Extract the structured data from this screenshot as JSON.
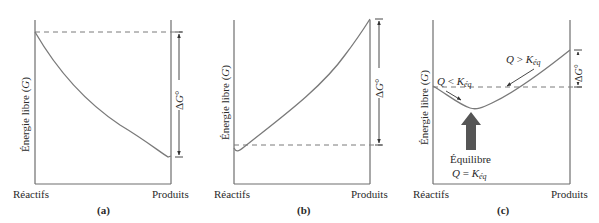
{
  "figure": {
    "panels": [
      {
        "id": "a",
        "caption": "(a)",
        "y_axis_label_prefix": "Énergie libre (",
        "y_axis_label_var": "G",
        "y_axis_label_suffix": ")",
        "x_left_label": "Réactifs",
        "x_right_label": "Produits",
        "delta_label_prefix": "Δ",
        "delta_label_var": "G",
        "delta_label_suffix": "°"
      },
      {
        "id": "b",
        "caption": "(b)",
        "y_axis_label_prefix": "Énergie libre (",
        "y_axis_label_var": "G",
        "y_axis_label_suffix": ")",
        "x_left_label": "Réactifs",
        "x_right_label": "Produits",
        "delta_label_prefix": "Δ",
        "delta_label_var": "G",
        "delta_label_suffix": "°"
      },
      {
        "id": "c",
        "caption": "(c)",
        "y_axis_label_prefix": "Énergie libre (",
        "y_axis_label_var": "G",
        "y_axis_label_suffix": ")",
        "x_left_label": "Réactifs",
        "x_right_label": "Produits",
        "delta_label_prefix": "Δ",
        "delta_label_var": "G",
        "delta_label_suffix": "°",
        "annotation_left_Q": "Q",
        "annotation_left_rel": " < ",
        "annotation_left_K": "K",
        "annotation_left_sub": "éq",
        "annotation_right_Q": "Q",
        "annotation_right_rel": " > ",
        "annotation_right_K": "K",
        "annotation_right_sub": "éq",
        "equilibrium_label": "Équilibre",
        "equilibrium_Q": "Q",
        "equilibrium_rel": " = ",
        "equilibrium_K": "K",
        "equilibrium_sub": "éq"
      }
    ],
    "colors": {
      "axis": "#6e6e6e",
      "curve": "#7a7a7a",
      "dashed": "#7a7a7a",
      "text": "#2a2a2a",
      "arrow_fill": "#555555"
    }
  }
}
